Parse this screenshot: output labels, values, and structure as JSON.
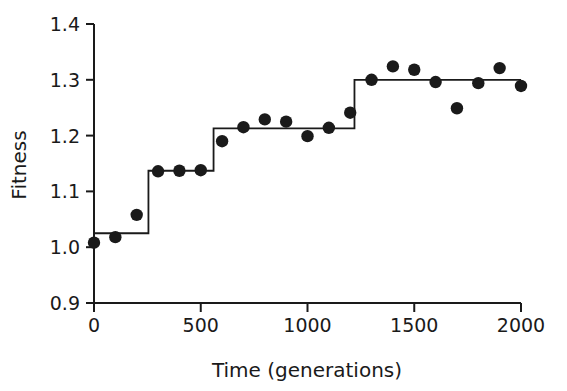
{
  "chart_data": {
    "type": "scatter",
    "title": "",
    "xlabel": "Time (generations)",
    "ylabel": "Fitness",
    "xlim": [
      0,
      2000
    ],
    "ylim": [
      0.9,
      1.4
    ],
    "xticks": [
      0,
      500,
      1000,
      1500,
      2000
    ],
    "xtick_labels": [
      "0",
      "500",
      "1000",
      "1500",
      "2000"
    ],
    "yticks": [
      0.9,
      1.0,
      1.1,
      1.2,
      1.3,
      1.4
    ],
    "ytick_labels": [
      "0.9",
      "1.0",
      "1.1",
      "1.2",
      "1.3",
      "1.4"
    ],
    "grid": false,
    "legend": "none",
    "marker_color": "#1a1a1a",
    "line_color": "#1a1a1a",
    "series": [
      {
        "name": "Fitness measurements",
        "type": "scatter",
        "points": [
          {
            "x": 0,
            "y": 1.008
          },
          {
            "x": 100,
            "y": 1.018
          },
          {
            "x": 200,
            "y": 1.058
          },
          {
            "x": 300,
            "y": 1.136
          },
          {
            "x": 400,
            "y": 1.137
          },
          {
            "x": 500,
            "y": 1.138
          },
          {
            "x": 600,
            "y": 1.19
          },
          {
            "x": 700,
            "y": 1.215
          },
          {
            "x": 800,
            "y": 1.229
          },
          {
            "x": 900,
            "y": 1.225
          },
          {
            "x": 1000,
            "y": 1.199
          },
          {
            "x": 1100,
            "y": 1.214
          },
          {
            "x": 1200,
            "y": 1.241
          },
          {
            "x": 1300,
            "y": 1.3
          },
          {
            "x": 1400,
            "y": 1.324
          },
          {
            "x": 1500,
            "y": 1.318
          },
          {
            "x": 1600,
            "y": 1.296
          },
          {
            "x": 1700,
            "y": 1.249
          },
          {
            "x": 1800,
            "y": 1.294
          },
          {
            "x": 1900,
            "y": 1.321
          },
          {
            "x": 2000,
            "y": 1.289
          }
        ]
      },
      {
        "name": "Fitted step function",
        "type": "step",
        "steps": [
          {
            "x_start": 0,
            "x_end": 255,
            "y": 1.025
          },
          {
            "x_start": 255,
            "x_end": 560,
            "y": 1.137
          },
          {
            "x_start": 560,
            "x_end": 1220,
            "y": 1.213
          },
          {
            "x_start": 1220,
            "x_end": 2000,
            "y": 1.3
          }
        ]
      }
    ]
  }
}
